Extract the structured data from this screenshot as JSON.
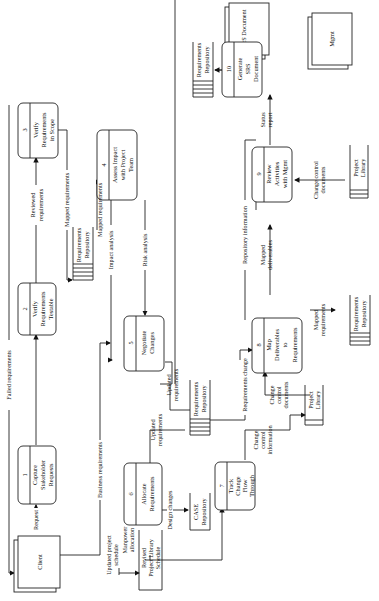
{
  "diagram": {
    "type": "data-flow-diagram",
    "orientation": "rotated-90-ccw",
    "external_entities": {
      "client": "Client",
      "srs_document": "SRS Document",
      "mgmt": "Mgmt"
    },
    "processes": {
      "p1": {
        "num": "1",
        "line1": "Capture",
        "line2": "Stakeholder",
        "line3": "Requests"
      },
      "p2": {
        "num": "2",
        "line1": "Verify",
        "line2": "Requirements",
        "line3": "Testable"
      },
      "p3": {
        "num": "3",
        "line1": "Verify",
        "line2": "Requirements",
        "line3": "in Scope"
      },
      "p4": {
        "num": "4",
        "line1": "Assess Impact",
        "line2": "with Project",
        "line3": "Team"
      },
      "p5": {
        "num": "5",
        "line1": "Negotiate",
        "line2": "Changes"
      },
      "p6": {
        "num": "6",
        "line1": "Allocate",
        "line2": "Requirements"
      },
      "p7": {
        "num": "7",
        "line1": "Track",
        "line2": "Change",
        "line3": "Flow",
        "line4": "Through"
      },
      "p8": {
        "num": "8",
        "line1": "Map",
        "line2": "Deliverables",
        "line3": "to",
        "line4": "Requirements"
      },
      "p9": {
        "num": "9",
        "line1": "Review",
        "line2": "Activities",
        "line3": "with Mgmt"
      },
      "p10": {
        "num": "10",
        "line1": "Generate",
        "line2": "SRS",
        "line3": "Document"
      }
    },
    "data_stores": {
      "req_repo_line1": "Requirements",
      "req_repo_line2": "Repository",
      "case_line1": "CASE",
      "case_line2": "Repository",
      "project_library_line1": "Project",
      "project_library_line2": "Library",
      "revised_line1": "Revised",
      "revised_line2": "Project Library",
      "revised_line3": "Schedule"
    },
    "flows": {
      "failed_requirements": "Failed requirements",
      "request": "Request",
      "business_requirements": "Business requirements",
      "reviewed_1": "Reviewed",
      "reviewed_2": "requirements",
      "mapped_requirements": "Mapped requirements",
      "impact_analysis": "Impact analysis",
      "risk_analysis": "Risk analysis",
      "repository_information": "Repository information",
      "updated_1": "Updated",
      "updated_2": "requirements",
      "requirements_change": "Requirements change",
      "design_changes": "Design changes",
      "updated_project_1": "Updated project",
      "updated_project_2": "schedule",
      "manpower_1": "Manpower",
      "manpower_2": "allocation",
      "change_control_1": "Change",
      "change_control_2": "control",
      "change_control_info": "information",
      "change_control_docs": "documents",
      "change_control_docs_full": "Change control",
      "mapped_1": "Mapped",
      "mapped_req_2": "requirements",
      "mapped_deliv_2": "deliverables",
      "status_1": "Status",
      "status_2": "report"
    }
  }
}
